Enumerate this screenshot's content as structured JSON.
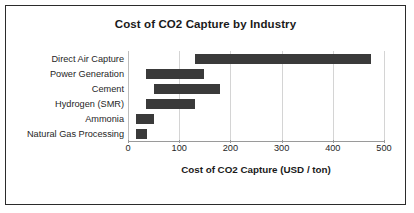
{
  "chart_data": {
    "type": "bar",
    "orientation": "horizontal",
    "bar_style": "floating-range",
    "title": "Cost of CO2 Capture by Industry",
    "xlabel": "Cost of CO2 Capture (USD / ton)",
    "ylabel": "",
    "xlim": [
      0,
      500
    ],
    "xticks": [
      0,
      100,
      200,
      300,
      400,
      500
    ],
    "xtick_labels": [
      "0",
      "100",
      "200",
      "300",
      "400",
      "500"
    ],
    "grid": "vertical",
    "legend": "none",
    "categories": [
      "Direct Air Capture",
      "Power Generation",
      "Cement",
      "Hydrogen (SMR)",
      "Ammonia",
      "Natural Gas Processing"
    ],
    "series": [
      {
        "name": "low",
        "values": [
          130,
          35,
          50,
          35,
          15,
          15
        ]
      },
      {
        "name": "high",
        "values": [
          475,
          148,
          180,
          130,
          50,
          37
        ]
      }
    ],
    "ranges": [
      {
        "category": "Direct Air Capture",
        "low": 130,
        "high": 475
      },
      {
        "category": "Power Generation",
        "low": 35,
        "high": 148
      },
      {
        "category": "Cement",
        "low": 50,
        "high": 180
      },
      {
        "category": "Hydrogen (SMR)",
        "low": 35,
        "high": 130
      },
      {
        "category": "Ammonia",
        "low": 15,
        "high": 50
      },
      {
        "category": "Natural Gas Processing",
        "low": 15,
        "high": 37
      }
    ],
    "colors": {
      "bar": "#3a3a3a",
      "grid": "#d4d4d4",
      "axis": "#9a9a9a",
      "text": "#1a1a1a",
      "background": "#ffffff",
      "border": "#2b2b2b"
    }
  }
}
